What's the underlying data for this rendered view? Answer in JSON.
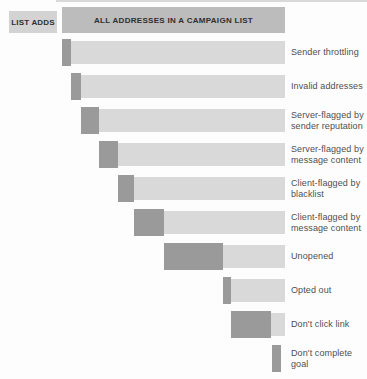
{
  "header": {
    "left_label": "LIST ADDS",
    "right_label": "ALL ADDRESSES IN A CAMPAIGN LIST"
  },
  "colors": {
    "light_bar": "#d9d9d9",
    "header_left_bar": "#d3d3d3",
    "header_right_bar": "#bcbcbc",
    "dark_segment": "#9a9a9a",
    "label_text": "#4f4f4f",
    "header_text": "#2f2f2f",
    "page_edge_line": "#d9d9d9"
  },
  "chart_data": {
    "type": "bar",
    "subtype": "cascading-attrition-funnel",
    "title": "ALL ADDRESSES IN A CAMPAIGN LIST",
    "start_label": "LIST ADDS",
    "orientation": "horizontal",
    "axis_range_pct": [
      0,
      100
    ],
    "grid": false,
    "legend_position": "right-labels",
    "stages": [
      {
        "label": "Sender throttling",
        "lines": [
          "Sender throttling"
        ],
        "loss_start_pct": 0.0,
        "loss_pct": 4.0,
        "has_remainder": true
      },
      {
        "label": "Invalid addresses",
        "lines": [
          "Invalid addresses"
        ],
        "loss_start_pct": 4.0,
        "loss_pct": 4.5,
        "has_remainder": true
      },
      {
        "label": "Server-flagged by sender reputation",
        "lines": [
          "Server-flagged by",
          "sender reputation"
        ],
        "loss_start_pct": 8.5,
        "loss_pct": 8.1,
        "has_remainder": true
      },
      {
        "label": "Server-flagged by message content",
        "lines": [
          "Server-flagged by",
          "message content"
        ],
        "loss_start_pct": 16.6,
        "loss_pct": 8.5,
        "has_remainder": true
      },
      {
        "label": "Client-flagged by blacklist",
        "lines": [
          "Client-flagged by",
          "blacklist"
        ],
        "loss_start_pct": 25.1,
        "loss_pct": 7.2,
        "has_remainder": true
      },
      {
        "label": "Client-flagged by message content",
        "lines": [
          "Client-flagged by",
          "message content"
        ],
        "loss_start_pct": 32.3,
        "loss_pct": 13.5,
        "has_remainder": true
      },
      {
        "label": "Unopened",
        "lines": [
          "Unopened"
        ],
        "loss_start_pct": 45.8,
        "loss_pct": 26.4,
        "has_remainder": true
      },
      {
        "label": "Opted out",
        "lines": [
          "Opted out"
        ],
        "loss_start_pct": 72.2,
        "loss_pct": 3.6,
        "has_remainder": true
      },
      {
        "label": "Don't click link",
        "lines": [
          "Don't click link"
        ],
        "loss_start_pct": 75.8,
        "loss_pct": 17.9,
        "has_remainder": true
      },
      {
        "label": "Don't complete goal",
        "lines": [
          "Don't complete goal"
        ],
        "loss_start_pct": 94.2,
        "loss_pct": 4.0,
        "has_remainder": false
      }
    ]
  }
}
